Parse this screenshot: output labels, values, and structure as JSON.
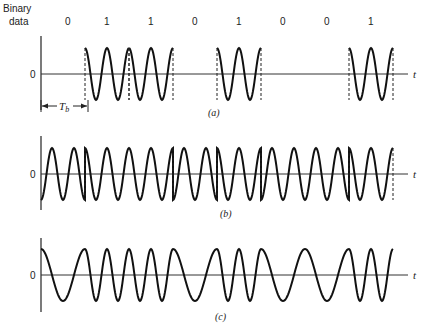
{
  "header": {
    "binary_label_line1": "Binary",
    "binary_label_line2": "data"
  },
  "bits": [
    "0",
    "1",
    "1",
    "0",
    "1",
    "0",
    "0",
    "1"
  ],
  "axis": {
    "zero_label": "0",
    "time_label": "t",
    "bit_period_label": "T",
    "bit_period_subscript": "b"
  },
  "panels": [
    {
      "id": "a",
      "caption": "(a)",
      "modulation": "on-off keying"
    },
    {
      "id": "b",
      "caption": "(b)",
      "modulation": "phase-shift keying"
    },
    {
      "id": "c",
      "caption": "(c)",
      "modulation": "frequency-shift keying"
    }
  ],
  "layout": {
    "x0": 41,
    "bit_width": 44,
    "amplitude": 26,
    "zero_y": [
      74,
      174,
      275
    ],
    "axis_end_x": 408,
    "cycles_per_bit_high": 2,
    "cycles_per_bit_low_fsk": 1
  },
  "colors": {
    "stroke": "#111111",
    "axis": "#333333"
  }
}
